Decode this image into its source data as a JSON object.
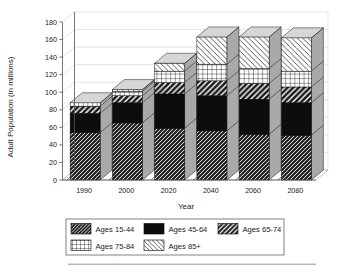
{
  "chart_data": {
    "type": "bar",
    "subtype": "stacked-bar-3d",
    "title": "",
    "xlabel": "Year",
    "ylabel": "Adult Population (in millions)",
    "categories": [
      "1990",
      "2000",
      "2020",
      "2040",
      "2060",
      "2080"
    ],
    "ylim": [
      0,
      180
    ],
    "ytick_step": 20,
    "yticks": [
      "0",
      "20",
      "40",
      "60",
      "80",
      "100",
      "120",
      "140",
      "160",
      "180"
    ],
    "grid": true,
    "legend_position": "bottom",
    "series": [
      {
        "name": "Ages 15-44",
        "pattern": "dense-diagonal-dark",
        "values": [
          54,
          65,
          59,
          56,
          52,
          51
        ]
      },
      {
        "name": "Ages 45-64",
        "pattern": "solid-black",
        "values": [
          22,
          23,
          39,
          40,
          40,
          37
        ]
      },
      {
        "name": "Ages 65-74",
        "pattern": "bold-diagonal-stripe",
        "values": [
          8,
          8,
          13,
          17,
          18,
          18
        ]
      },
      {
        "name": "Ages 75-84",
        "pattern": "grid-crosshatch",
        "values": [
          4,
          5,
          13,
          19,
          17,
          18
        ]
      },
      {
        "name": "Ages 85+",
        "pattern": "light-diagonal",
        "values": [
          0,
          2,
          9,
          31,
          36,
          38
        ]
      }
    ],
    "totals": [
      88,
      103,
      133,
      163,
      163,
      162
    ],
    "colors": {
      "plot_background": "#ffffff",
      "grid": "#c8c8c8",
      "axis": "#555555",
      "segment_outline": "#000000",
      "bar_side_shading": "#a8a8a8",
      "bar_top_shading": "#d4d4d4"
    }
  },
  "axis": {
    "y_title": "Adult Population (in millions)",
    "x_title": "Year"
  },
  "legend": {
    "items": [
      {
        "label": "Ages 15-44",
        "swatch": "dense-diagonal-dark-swatch"
      },
      {
        "label": "Ages 45-64",
        "swatch": "solid-black-swatch"
      },
      {
        "label": "Ages 65-74",
        "swatch": "bold-diagonal-stripe-swatch"
      },
      {
        "label": "Ages 75-84",
        "swatch": "grid-crosshatch-swatch"
      },
      {
        "label": "Ages 85+",
        "swatch": "light-diagonal-swatch"
      }
    ]
  }
}
